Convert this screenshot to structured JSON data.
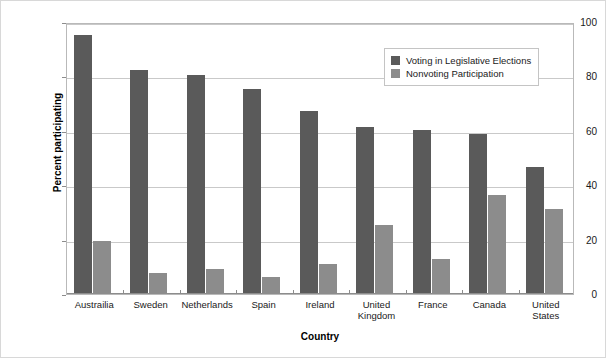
{
  "chart_data": {
    "type": "bar",
    "title": "",
    "subtitle": "",
    "xlabel": "Country",
    "ylabel": "Percent participating",
    "ylim": [
      0,
      100
    ],
    "yticks": [
      0,
      20,
      40,
      60,
      80,
      100
    ],
    "ytick_labels": [
      "0",
      "20",
      "40",
      "60",
      "80",
      "100"
    ],
    "grid": "horizontal",
    "legend_position": "top-right",
    "categories": [
      "Austrailia",
      "Sweden",
      "Netherlands",
      "Spain",
      "Ireland",
      "United\nKingdom",
      "France",
      "Canada",
      "United\nStates"
    ],
    "series": [
      {
        "name": "Voting in Legislative Elections",
        "color": "#5a5a5a",
        "values": [
          95,
          82,
          80,
          75,
          67,
          61,
          60,
          58.5,
          46.5
        ]
      },
      {
        "name": "Nonvoting Participation",
        "color": "#8c8c8c",
        "values": [
          19,
          7.5,
          9,
          6,
          10.5,
          25,
          12.5,
          36,
          31
        ]
      }
    ]
  },
  "legend": {
    "items": [
      {
        "label": "Voting in Legislative Elections",
        "color": "#5a5a5a"
      },
      {
        "label": "Nonvoting Participation",
        "color": "#8c8c8c"
      }
    ]
  }
}
